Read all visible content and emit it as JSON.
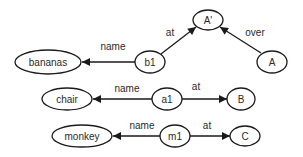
{
  "diagram": {
    "type": "semantic-network",
    "nodes": [
      {
        "id": "A_prime",
        "label": "A'",
        "cx": 208,
        "cy": 20,
        "rx": 15,
        "ry": 10
      },
      {
        "id": "A",
        "label": "A",
        "cx": 272,
        "cy": 62,
        "rx": 15,
        "ry": 11
      },
      {
        "id": "b1",
        "label": "b1",
        "cx": 150,
        "cy": 62,
        "rx": 15,
        "ry": 11
      },
      {
        "id": "bananas",
        "label": "bananas",
        "cx": 48,
        "cy": 62,
        "rx": 33,
        "ry": 12
      },
      {
        "id": "chair",
        "label": "chair",
        "cx": 67,
        "cy": 99,
        "rx": 25,
        "ry": 11
      },
      {
        "id": "a1",
        "label": "a1",
        "cx": 167,
        "cy": 99,
        "rx": 15,
        "ry": 11
      },
      {
        "id": "B",
        "label": "B",
        "cx": 241,
        "cy": 99,
        "rx": 14,
        "ry": 11
      },
      {
        "id": "monkey",
        "label": "monkey",
        "cx": 82,
        "cy": 136,
        "rx": 30,
        "ry": 11
      },
      {
        "id": "m1",
        "label": "m1",
        "cx": 175,
        "cy": 136,
        "rx": 15,
        "ry": 11
      },
      {
        "id": "C",
        "label": "C",
        "cx": 245,
        "cy": 136,
        "rx": 15,
        "ry": 10
      }
    ],
    "edges": [
      {
        "from": "b1",
        "to": "bananas",
        "label": "name",
        "x1": 135,
        "y1": 62,
        "x2": 82,
        "y2": 62,
        "lx": 113,
        "ly": 46
      },
      {
        "from": "b1",
        "to": "A_prime",
        "label": "at",
        "x1": 161,
        "y1": 54,
        "x2": 196,
        "y2": 27,
        "lx": 170,
        "ly": 32
      },
      {
        "from": "A",
        "to": "A_prime",
        "label": "over",
        "x1": 261,
        "y1": 53,
        "x2": 220,
        "y2": 27,
        "lx": 255,
        "ly": 32
      },
      {
        "from": "a1",
        "to": "chair",
        "label": "name",
        "x1": 152,
        "y1": 99,
        "x2": 93,
        "y2": 99,
        "lx": 127,
        "ly": 88
      },
      {
        "from": "a1",
        "to": "B",
        "label": "at",
        "x1": 182,
        "y1": 99,
        "x2": 227,
        "y2": 99,
        "lx": 196,
        "ly": 86
      },
      {
        "from": "m1",
        "to": "monkey",
        "label": "name",
        "x1": 160,
        "y1": 136,
        "x2": 113,
        "y2": 136,
        "lx": 142,
        "ly": 125
      },
      {
        "from": "m1",
        "to": "C",
        "label": "at",
        "x1": 190,
        "y1": 136,
        "x2": 230,
        "y2": 136,
        "lx": 207,
        "ly": 125
      }
    ]
  },
  "colors": {
    "stroke": "#1a1a1a",
    "text": "#2a2a2a",
    "background": "#ffffff"
  }
}
